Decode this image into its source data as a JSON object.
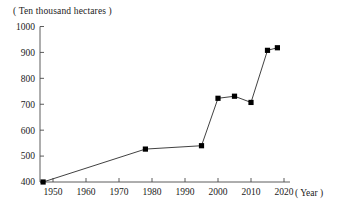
{
  "chart_data": {
    "type": "line",
    "title": "( Ten thousand hectares )",
    "xlabel": "( Year )",
    "ylabel": "( Ten thousand hectares )",
    "xlim": [
      1945,
      2022
    ],
    "ylim": [
      380,
      1000
    ],
    "xticks": [
      1950,
      1960,
      1970,
      1980,
      1990,
      2000,
      2010,
      2020
    ],
    "xtick_labels": [
      "1950",
      "1960",
      "1970",
      "1980",
      "1990",
      "2000",
      "2010",
      "2020"
    ],
    "yticks": [
      400,
      500,
      600,
      700,
      800,
      900,
      1000
    ],
    "ytick_labels": [
      "400",
      "500",
      "600",
      "700",
      "800",
      "900",
      "1000"
    ],
    "grid": false,
    "legend": "none",
    "marker": "square",
    "line_color": "#2b2b2b",
    "marker_color": "#000000",
    "x": [
      1947,
      1978,
      1995,
      2000,
      2005,
      2010,
      2015,
      2018
    ],
    "values": [
      400,
      527,
      540,
      723,
      731,
      707,
      908,
      918
    ],
    "points": [
      {
        "x": 1947,
        "y": 400
      },
      {
        "x": 1978,
        "y": 527
      },
      {
        "x": 1995,
        "y": 540
      },
      {
        "x": 2000,
        "y": 723
      },
      {
        "x": 2005,
        "y": 731
      },
      {
        "x": 2010,
        "y": 707
      },
      {
        "x": 2015,
        "y": 908
      },
      {
        "x": 2018,
        "y": 918
      }
    ]
  },
  "axes": {
    "unit_caption": "( Ten thousand hectares )",
    "x_axis_caption": "( Year )"
  }
}
